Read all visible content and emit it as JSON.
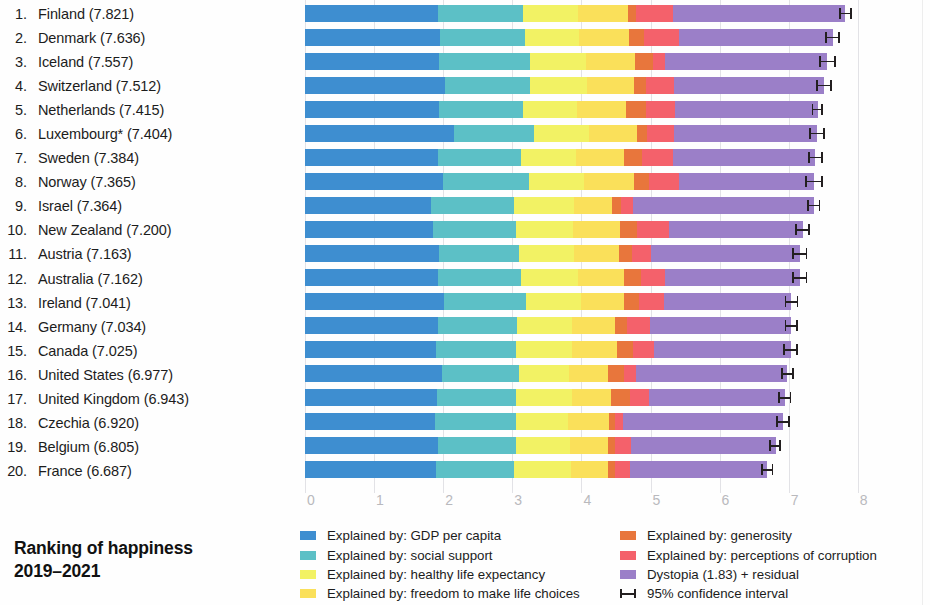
{
  "figure": {
    "title_line1": "Ranking of happiness",
    "title_line2": "2019–2021"
  },
  "legend": {
    "left": [
      {
        "label": "Explained by: GDP per capita",
        "color": "#3e8ed0",
        "key": "gdp"
      },
      {
        "label": "Explained by: social support",
        "color": "#5cc0c6",
        "key": "social"
      },
      {
        "label": "Explained by: healthy life expectancy",
        "color": "#f2f264",
        "key": "health"
      },
      {
        "label": "Explained by: freedom to make life choices",
        "color": "#fae05a",
        "key": "freedom"
      }
    ],
    "right": [
      {
        "label": "Explained by: generosity",
        "color": "#e8763c",
        "key": "generosity"
      },
      {
        "label": "Explained by: perceptions of corruption",
        "color": "#f4616b",
        "key": "corruption"
      },
      {
        "label": "Dystopia (1.83) + residual",
        "color": "#9b7fc8",
        "key": "dystopia"
      },
      {
        "label": "95% confidence interval",
        "color": "#231f20",
        "key": "ci"
      }
    ]
  },
  "chart_data": {
    "type": "bar",
    "orientation": "horizontal",
    "stacked": true,
    "title": "Ranking of happiness 2019–2021",
    "xlabel": "",
    "ylabel": "",
    "xlim": [
      0,
      8
    ],
    "xticks": [
      0,
      1,
      2,
      3,
      4,
      5,
      6,
      7,
      8
    ],
    "xtick_labels": [
      "0",
      "1",
      "2",
      "3",
      "4",
      "5",
      "6",
      "7",
      "8"
    ],
    "grid": true,
    "legend_position": "bottom",
    "series": [
      {
        "name": "Explained by: GDP per capita",
        "key": "gdp",
        "color": "#3e8ed0"
      },
      {
        "name": "Explained by: social support",
        "key": "social",
        "color": "#5cc0c6"
      },
      {
        "name": "Explained by: healthy life expectancy",
        "key": "health",
        "color": "#f2f264"
      },
      {
        "name": "Explained by: freedom to make life choices",
        "key": "freedom",
        "color": "#fae05a"
      },
      {
        "name": "Explained by: generosity",
        "key": "generosity",
        "color": "#e8763c"
      },
      {
        "name": "Explained by: perceptions of corruption",
        "key": "corruption",
        "color": "#f4616b"
      },
      {
        "name": "Dystopia (1.83) + residual",
        "key": "dystopia",
        "color": "#9b7fc8"
      }
    ],
    "rows": [
      {
        "rank": "1.",
        "country": "Finland",
        "score": "7.821",
        "label": "Finland (7.821)",
        "gdp": 1.92,
        "social": 1.23,
        "health": 0.8,
        "freedom": 0.72,
        "generosity": 0.12,
        "corruption": 0.53,
        "dystopia": 2.49,
        "total": 7.821,
        "ci_low": 7.73,
        "ci_high": 7.92
      },
      {
        "rank": "2.",
        "country": "Denmark",
        "score": "7.636",
        "label": "Denmark (7.636)",
        "gdp": 1.95,
        "social": 1.24,
        "health": 0.78,
        "freedom": 0.72,
        "generosity": 0.21,
        "corruption": 0.51,
        "dystopia": 2.23,
        "total": 7.636,
        "ci_low": 7.53,
        "ci_high": 7.74
      },
      {
        "rank": "3.",
        "country": "Iceland",
        "score": "7.557",
        "label": "Iceland (7.557)",
        "gdp": 1.94,
        "social": 1.32,
        "health": 0.8,
        "freedom": 0.72,
        "generosity": 0.25,
        "corruption": 0.18,
        "dystopia": 2.35,
        "total": 7.557,
        "ci_low": 7.44,
        "ci_high": 7.68
      },
      {
        "rank": "4.",
        "country": "Switzerland",
        "score": "7.512",
        "label": "Switzerland (7.512)",
        "gdp": 2.03,
        "social": 1.23,
        "health": 0.82,
        "freedom": 0.68,
        "generosity": 0.17,
        "corruption": 0.41,
        "dystopia": 2.17,
        "total": 7.512,
        "ci_low": 7.4,
        "ci_high": 7.62
      },
      {
        "rank": "5.",
        "country": "Netherlands",
        "score": "7.415",
        "label": "Netherlands (7.415)",
        "gdp": 1.94,
        "social": 1.21,
        "health": 0.79,
        "freedom": 0.7,
        "generosity": 0.29,
        "corruption": 0.42,
        "dystopia": 2.07,
        "total": 7.415,
        "ci_low": 7.33,
        "ci_high": 7.5
      },
      {
        "rank": "6.",
        "country": "Luxembourg*",
        "score": "7.404",
        "label": "Luxembourg* (7.404)",
        "gdp": 2.15,
        "social": 1.17,
        "health": 0.79,
        "freedom": 0.7,
        "generosity": 0.14,
        "corruption": 0.39,
        "dystopia": 2.07,
        "total": 7.404,
        "ci_low": 7.29,
        "ci_high": 7.52
      },
      {
        "rank": "7.",
        "country": "Sweden",
        "score": "7.384",
        "label": "Sweden (7.384)",
        "gdp": 1.92,
        "social": 1.2,
        "health": 0.8,
        "freedom": 0.69,
        "generosity": 0.26,
        "corruption": 0.45,
        "dystopia": 2.06,
        "total": 7.384,
        "ci_low": 7.28,
        "ci_high": 7.49
      },
      {
        "rank": "8.",
        "country": "Norway",
        "score": "7.365",
        "label": "Norway (7.365)",
        "gdp": 2.0,
        "social": 1.24,
        "health": 0.8,
        "freedom": 0.72,
        "generosity": 0.22,
        "corruption": 0.43,
        "dystopia": 1.95,
        "total": 7.365,
        "ci_low": 7.24,
        "ci_high": 7.49
      },
      {
        "rank": "9.",
        "country": "Israel",
        "score": "7.364",
        "label": "Israel (7.364)",
        "gdp": 1.83,
        "social": 1.2,
        "health": 0.87,
        "freedom": 0.54,
        "generosity": 0.14,
        "corruption": 0.17,
        "dystopia": 2.61,
        "total": 7.364,
        "ci_low": 7.27,
        "ci_high": 7.46
      },
      {
        "rank": "10.",
        "country": "New Zealand",
        "score": "7.200",
        "label": "New Zealand (7.200)",
        "gdp": 1.85,
        "social": 1.21,
        "health": 0.82,
        "freedom": 0.68,
        "generosity": 0.25,
        "corruption": 0.46,
        "dystopia": 1.93,
        "total": 7.2,
        "ci_low": 7.09,
        "ci_high": 7.31
      },
      {
        "rank": "11.",
        "country": "Austria",
        "score": "7.163",
        "label": "Austria (7.163)",
        "gdp": 1.94,
        "social": 1.16,
        "health": 0.8,
        "freedom": 0.65,
        "generosity": 0.18,
        "corruption": 0.28,
        "dystopia": 2.15,
        "total": 7.163,
        "ci_low": 7.05,
        "ci_high": 7.27
      },
      {
        "rank": "12.",
        "country": "Australia",
        "score": "7.162",
        "label": "Australia (7.162)",
        "gdp": 1.93,
        "social": 1.2,
        "health": 0.82,
        "freedom": 0.66,
        "generosity": 0.25,
        "corruption": 0.35,
        "dystopia": 1.95,
        "total": 7.162,
        "ci_low": 7.05,
        "ci_high": 7.27
      },
      {
        "rank": "13.",
        "country": "Ireland",
        "score": "7.041",
        "label": "Ireland (7.041)",
        "gdp": 2.01,
        "social": 1.19,
        "health": 0.8,
        "freedom": 0.62,
        "generosity": 0.21,
        "corruption": 0.37,
        "dystopia": 1.84,
        "total": 7.041,
        "ci_low": 6.94,
        "ci_high": 7.14
      },
      {
        "rank": "14.",
        "country": "Germany",
        "score": "7.034",
        "label": "Germany (7.034)",
        "gdp": 1.92,
        "social": 1.15,
        "health": 0.79,
        "freedom": 0.63,
        "generosity": 0.17,
        "corruption": 0.33,
        "dystopia": 2.04,
        "total": 7.034,
        "ci_low": 6.94,
        "ci_high": 7.13
      },
      {
        "rank": "15.",
        "country": "Canada",
        "score": "7.025",
        "label": "Canada (7.025)",
        "gdp": 1.89,
        "social": 1.17,
        "health": 0.81,
        "freedom": 0.65,
        "generosity": 0.22,
        "corruption": 0.31,
        "dystopia": 1.98,
        "total": 7.025,
        "ci_low": 6.92,
        "ci_high": 7.13
      },
      {
        "rank": "16.",
        "country": "United States",
        "score": "6.977",
        "label": "United States (6.977)",
        "gdp": 1.98,
        "social": 1.12,
        "health": 0.72,
        "freedom": 0.57,
        "generosity": 0.23,
        "corruption": 0.17,
        "dystopia": 2.19,
        "total": 6.977,
        "ci_low": 6.89,
        "ci_high": 7.07
      },
      {
        "rank": "17.",
        "country": "United Kingdom",
        "score": "6.943",
        "label": "United Kingdom (6.943)",
        "gdp": 1.91,
        "social": 1.15,
        "health": 0.8,
        "freedom": 0.57,
        "generosity": 0.28,
        "corruption": 0.27,
        "dystopia": 1.96,
        "total": 6.943,
        "ci_low": 6.85,
        "ci_high": 7.04
      },
      {
        "rank": "18.",
        "country": "Czechia",
        "score": "6.920",
        "label": "Czechia (6.920)",
        "gdp": 1.88,
        "social": 1.17,
        "health": 0.75,
        "freedom": 0.6,
        "generosity": 0.09,
        "corruption": 0.11,
        "dystopia": 2.32,
        "total": 6.92,
        "ci_low": 6.82,
        "ci_high": 7.02
      },
      {
        "rank": "19.",
        "country": "Belgium",
        "score": "6.805",
        "label": "Belgium (6.805)",
        "gdp": 1.92,
        "social": 1.13,
        "health": 0.78,
        "freedom": 0.55,
        "generosity": 0.11,
        "corruption": 0.23,
        "dystopia": 2.09,
        "total": 6.805,
        "ci_low": 6.72,
        "ci_high": 6.89
      },
      {
        "rank": "20.",
        "country": "France",
        "score": "6.687",
        "label": "France (6.687)",
        "gdp": 1.89,
        "social": 1.14,
        "health": 0.82,
        "freedom": 0.54,
        "generosity": 0.1,
        "corruption": 0.21,
        "dystopia": 1.99,
        "total": 6.687,
        "ci_low": 6.6,
        "ci_high": 6.78
      }
    ]
  }
}
